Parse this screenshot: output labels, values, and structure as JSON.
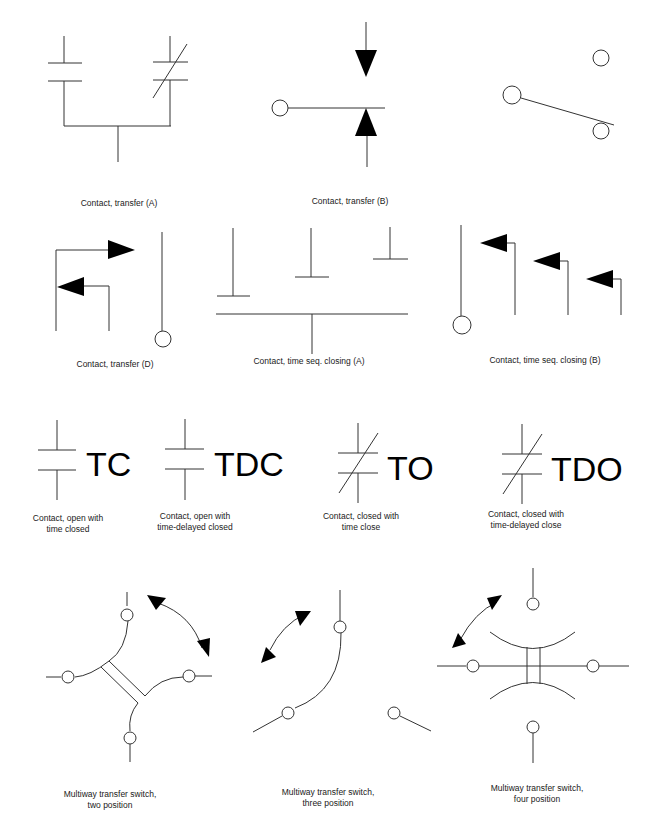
{
  "symbols": [
    {
      "id": "contact-transfer-a",
      "label": "Contact, transfer (A)"
    },
    {
      "id": "contact-transfer-b",
      "label": "Contact, transfer (B)"
    },
    {
      "id": "contact-transfer-c-unlabeled",
      "label": ""
    },
    {
      "id": "contact-transfer-d",
      "label": "Contact, transfer (D)"
    },
    {
      "id": "contact-time-seq-closing-a",
      "label": "Contact, time seq. closing (A)"
    },
    {
      "id": "contact-time-seq-closing-b",
      "label": "Contact, time seq. closing (B)"
    },
    {
      "id": "contact-open-time-closed",
      "code": "TC",
      "label_line1": "Contact, open with",
      "label_line2": "time closed"
    },
    {
      "id": "contact-open-time-delayed-closed",
      "code": "TDC",
      "label_line1": "Contact, open with",
      "label_line2": "time-delayed closed"
    },
    {
      "id": "contact-closed-time-close",
      "code": "TO",
      "label_line1": "Contact, closed with",
      "label_line2": "time close"
    },
    {
      "id": "contact-closed-time-delayed-close",
      "code": "TDO",
      "label_line1": "Contact, closed with",
      "label_line2": "time-delayed close"
    },
    {
      "id": "multiway-two-position",
      "label_line1": "Multiway transfer switch,",
      "label_line2": "two position"
    },
    {
      "id": "multiway-three-position",
      "label_line1": "Multiway transfer switch,",
      "label_line2": "three position"
    },
    {
      "id": "multiway-four-position",
      "label_line1": "Multiway transfer switch,",
      "label_line2": "four position"
    }
  ]
}
